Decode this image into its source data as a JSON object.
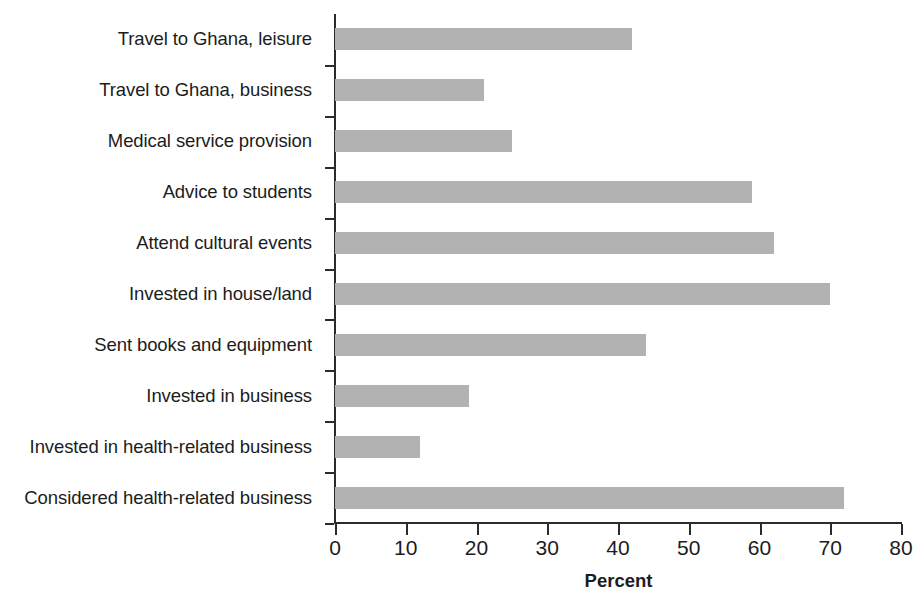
{
  "chart_data": {
    "type": "bar",
    "orientation": "horizontal",
    "title": "",
    "xlabel": "Percent",
    "ylabel": "",
    "xlim": [
      0,
      80
    ],
    "xticks": [
      0,
      10,
      20,
      30,
      40,
      50,
      60,
      70,
      80
    ],
    "xtick_labels": [
      "0",
      "10",
      "20",
      "30",
      "40",
      "50",
      "60",
      "70",
      "80"
    ],
    "grid": false,
    "legend": null,
    "bar_color": "#b2b2b2",
    "axis_color": "#2b2b2b",
    "categories": [
      "Travel to Ghana, leisure",
      "Travel to Ghana, business",
      "Medical service provision",
      "Advice to students",
      "Attend cultural events",
      "Invested in house/land",
      "Sent books and equipment",
      "Invested in business",
      "Invested in health-related business",
      "Considered health-related business"
    ],
    "values": [
      42,
      21,
      25,
      59,
      62,
      70,
      44,
      19,
      12,
      72
    ]
  }
}
